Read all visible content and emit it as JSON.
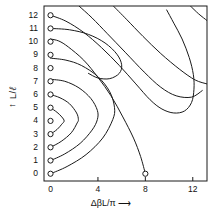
{
  "figure": {
    "background": "#ffffff",
    "ink": "#1a1a1a"
  },
  "axes": {
    "x_label_prefix": "Δ",
    "x_label_beta": "β",
    "x_label_rest": "L/",
    "x_label_pi": "π",
    "x_label_arrow": "⟶",
    "x_label_full": "ΔβL/π ⟶",
    "y_label_arrow": "↑",
    "y_label_num": "L/",
    "y_label_den": "ℓ",
    "y_label_full": "L/ℓ ↑",
    "xlim": [
      -0.55,
      13.2
    ],
    "ylim": [
      -0.55,
      12.7
    ],
    "xticks": [
      0,
      4,
      8,
      12
    ],
    "xticklabels": [
      "0",
      "4",
      "8",
      "12"
    ],
    "yticks": [
      0,
      1,
      2,
      3,
      4,
      5,
      6,
      7,
      8,
      9,
      10,
      11,
      12
    ],
    "yticklabels": [
      "0",
      "1",
      "2",
      "3",
      "4",
      "5",
      "6",
      "7",
      "8",
      "9",
      "10",
      "11",
      "12"
    ],
    "grid": false,
    "frame": "box"
  },
  "chart_data": {
    "type": "line",
    "title": "",
    "xlabel": "ΔβL/π ⟶",
    "ylabel": "L/ℓ ↑",
    "xlim": [
      -0.55,
      13.2
    ],
    "ylim": [
      -0.55,
      12.7
    ],
    "grid": false,
    "legend": "none",
    "x": [
      0,
      4,
      8,
      12
    ],
    "markers": {
      "name": "axis-markers",
      "style": "small open circle",
      "points": [
        {
          "x": 0,
          "y": 0
        },
        {
          "x": 0,
          "y": 1
        },
        {
          "x": 0,
          "y": 2
        },
        {
          "x": 0,
          "y": 3
        },
        {
          "x": 0,
          "y": 4
        },
        {
          "x": 0,
          "y": 5
        },
        {
          "x": 0,
          "y": 6
        },
        {
          "x": 0,
          "y": 7
        },
        {
          "x": 0,
          "y": 8
        },
        {
          "x": 0,
          "y": 9
        },
        {
          "x": 0,
          "y": 10
        },
        {
          "x": 0,
          "y": 11
        },
        {
          "x": 0,
          "y": 12
        },
        {
          "x": 8,
          "y": 0
        }
      ]
    },
    "series": [
      {
        "name": "contour-1",
        "points": [
          [
            0,
            3
          ],
          [
            0.55,
            3.35
          ],
          [
            0.95,
            3.75
          ],
          [
            1.15,
            4.0
          ],
          [
            0.95,
            4.3
          ],
          [
            0.55,
            4.65
          ],
          [
            0,
            5.0
          ]
        ]
      },
      {
        "name": "contour-2",
        "points": [
          [
            0,
            2
          ],
          [
            0.9,
            2.45
          ],
          [
            1.75,
            3.1
          ],
          [
            2.25,
            3.85
          ],
          [
            2.35,
            4.1
          ],
          [
            2.2,
            4.6
          ],
          [
            1.6,
            5.3
          ],
          [
            0.8,
            5.75
          ],
          [
            0,
            6.0
          ]
        ]
      },
      {
        "name": "contour-3",
        "points": [
          [
            0,
            1
          ],
          [
            1.2,
            1.5
          ],
          [
            2.5,
            2.3
          ],
          [
            3.5,
            3.3
          ],
          [
            3.95,
            4.1
          ],
          [
            3.95,
            4.8
          ],
          [
            3.4,
            5.7
          ],
          [
            2.4,
            6.5
          ],
          [
            1.2,
            7.0
          ],
          [
            0,
            7.15
          ]
        ]
      },
      {
        "name": "contour-4",
        "points": [
          [
            0,
            0
          ],
          [
            1.4,
            0.55
          ],
          [
            3.0,
            1.45
          ],
          [
            4.4,
            2.7
          ],
          [
            5.25,
            4.1
          ],
          [
            5.4,
            5.0
          ],
          [
            5.0,
            6.2
          ],
          [
            4.0,
            7.35
          ],
          [
            2.6,
            8.2
          ],
          [
            1.3,
            8.6
          ],
          [
            0,
            8.75
          ]
        ]
      },
      {
        "name": "contour-5",
        "points": [
          [
            8,
            0
          ],
          [
            7.6,
            1.3
          ],
          [
            7.0,
            2.7
          ],
          [
            6.1,
            4.3
          ],
          [
            5.1,
            5.9
          ],
          [
            4.0,
            7.3
          ],
          [
            2.8,
            8.6
          ],
          [
            1.5,
            9.6
          ],
          [
            0.7,
            10.05
          ],
          [
            0,
            10.2
          ]
        ]
      },
      {
        "name": "contour-6",
        "points": [
          [
            0,
            11.0
          ],
          [
            1.6,
            10.9
          ],
          [
            3.2,
            10.55
          ],
          [
            4.6,
            9.9
          ],
          [
            5.6,
            9.05
          ],
          [
            6.0,
            8.25
          ],
          [
            5.8,
            7.6
          ],
          [
            5.0,
            7.2
          ],
          [
            4.0,
            7.25
          ],
          [
            3.2,
            7.6
          ]
        ]
      },
      {
        "name": "contour-7",
        "points": [
          [
            0,
            12.0
          ],
          [
            1.3,
            11.55
          ],
          [
            2.8,
            10.7
          ],
          [
            4.3,
            9.55
          ],
          [
            5.8,
            8.2
          ],
          [
            7.2,
            6.8
          ],
          [
            8.4,
            5.6
          ],
          [
            9.4,
            4.9
          ],
          [
            10.4,
            4.6
          ],
          [
            11.3,
            4.75
          ],
          [
            11.9,
            5.4
          ],
          [
            12.1,
            6.4
          ],
          [
            12.05,
            7.5
          ],
          [
            11.7,
            8.8
          ],
          [
            11.1,
            10.2
          ],
          [
            10.4,
            11.4
          ],
          [
            9.8,
            12.4
          ]
        ]
      },
      {
        "name": "contour-8",
        "points": [
          [
            2.4,
            12.7
          ],
          [
            3.5,
            11.8
          ],
          [
            4.8,
            10.6
          ],
          [
            6.3,
            9.2
          ],
          [
            7.9,
            7.7
          ],
          [
            9.3,
            6.55
          ],
          [
            10.6,
            5.9
          ],
          [
            11.9,
            5.8
          ],
          [
            12.8,
            6.3
          ]
        ]
      },
      {
        "name": "contour-9",
        "points": [
          [
            5.3,
            12.7
          ],
          [
            6.4,
            11.7
          ],
          [
            7.8,
            10.4
          ],
          [
            9.3,
            9.1
          ],
          [
            10.9,
            7.9
          ],
          [
            12.2,
            7.1
          ],
          [
            13.2,
            6.8
          ]
        ]
      },
      {
        "name": "contour-10",
        "points": [
          [
            11.8,
            12.7
          ],
          [
            12.5,
            12.1
          ],
          [
            13.2,
            11.6
          ]
        ]
      }
    ]
  }
}
